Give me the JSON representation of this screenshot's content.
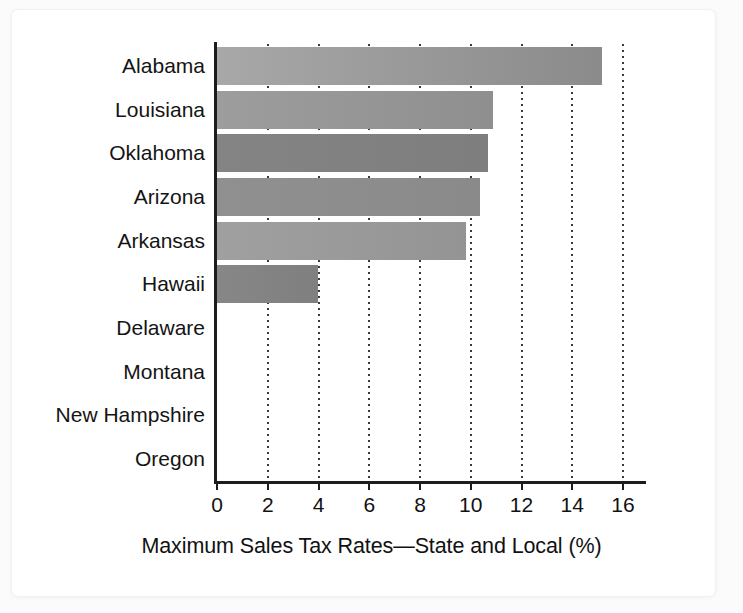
{
  "card": {
    "background_color": "#ffffff",
    "page_background_color": "#fbfbfb"
  },
  "chart_data": {
    "type": "bar",
    "orientation": "horizontal",
    "title": "",
    "subtitle": "",
    "xlabel": "Maximum Sales Tax Rates—State and Local (%)",
    "ylabel": "",
    "categories": [
      "Alabama",
      "Louisiana",
      "Oklahoma",
      "Arizona",
      "Arkansas",
      "Hawaii",
      "Delaware",
      "Montana",
      "New Hampshire",
      "Oregon"
    ],
    "values": [
      15.2,
      10.9,
      10.7,
      10.4,
      9.85,
      4.0,
      0,
      0,
      0,
      0
    ],
    "xlim": [
      0,
      16
    ],
    "xticks": [
      0,
      2,
      4,
      6,
      8,
      10,
      12,
      14,
      16
    ],
    "xtick_labels": [
      "0",
      "2",
      "4",
      "6",
      "8",
      "10",
      "12",
      "14",
      "16"
    ],
    "grid": "vertical-dotted",
    "legend": "none",
    "bar_colors": [
      "#a8a8a8",
      "#9d9d9d",
      "#848484",
      "#909090",
      "#a0a0a0",
      "#878787",
      "none",
      "none",
      "none",
      "none"
    ],
    "bar_colors_end": [
      "#8b8b8b",
      "#8f8f8f",
      "#7e7e7e",
      "#8a8a8a",
      "#949494",
      "#7f7f7f",
      "none",
      "none",
      "none",
      "none"
    ],
    "axis_color": "#1c1c1c",
    "gridline_color": "#3a3a3a",
    "text_color": "#111111"
  }
}
